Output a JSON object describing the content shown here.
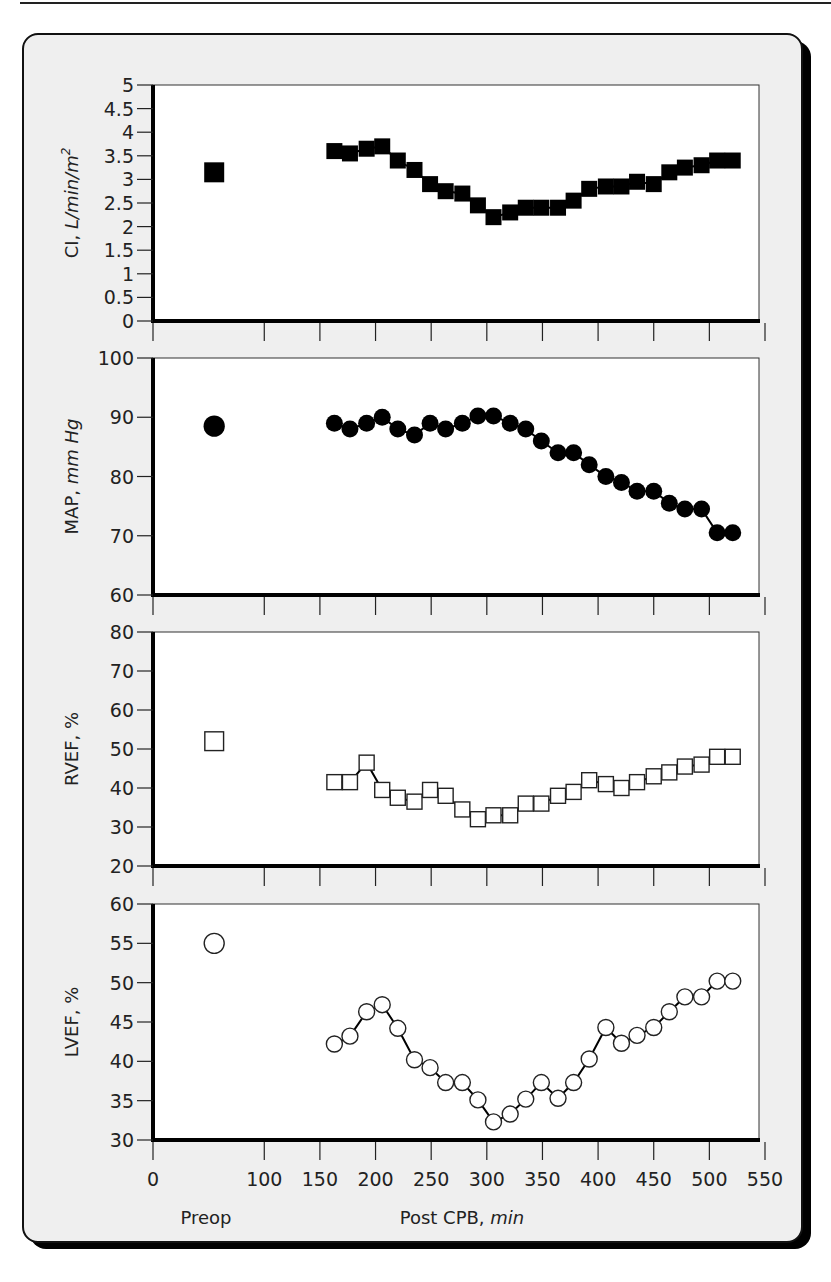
{
  "figure": {
    "xaxis": {
      "ticks": [
        "0",
        "100",
        "150",
        "200",
        "250",
        "300",
        "350",
        "400",
        "450",
        "500",
        "550"
      ],
      "preop_label": "Preop",
      "label_main": "Post CPB, ",
      "label_unit": "min"
    },
    "panels": [
      {
        "ylabel_main": "CI, ",
        "ylabel_unit": "L/min/m",
        "ylabel_sup": "2",
        "yticks": [
          "5",
          "4.5",
          "4",
          "3.5",
          "3",
          "2.5",
          "2",
          "1.5",
          "1",
          "0.5",
          "0"
        ]
      },
      {
        "ylabel_main": "MAP, ",
        "ylabel_unit": "mm Hg",
        "ylabel_sup": "",
        "yticks": [
          "100",
          "90",
          "80",
          "70",
          "60"
        ]
      },
      {
        "ylabel_main": "RVEF, %",
        "ylabel_unit": "",
        "ylabel_sup": "",
        "yticks": [
          "80",
          "70",
          "60",
          "50",
          "40",
          "30",
          "20"
        ]
      },
      {
        "ylabel_main": "LVEF, %",
        "ylabel_unit": "",
        "ylabel_sup": "",
        "yticks": [
          "60",
          "55",
          "50",
          "45",
          "40",
          "35",
          "30"
        ]
      }
    ]
  },
  "chart_data": [
    {
      "type": "line",
      "title": "",
      "ylabel": "CI, L/min/m2",
      "xlabel": "Post CPB, min",
      "ylim": [
        0,
        5
      ],
      "xlim": [
        0,
        550
      ],
      "marker": "filled-square",
      "preop": {
        "x": 55,
        "label": "Preop",
        "value": 3.15
      },
      "x": [
        163,
        177,
        192,
        206,
        220,
        235,
        249,
        263,
        278,
        292,
        306,
        321,
        335,
        349,
        364,
        378,
        392,
        407,
        421,
        435,
        450,
        464,
        478,
        493,
        507,
        521
      ],
      "values": [
        3.6,
        3.55,
        3.65,
        3.7,
        3.4,
        3.2,
        2.9,
        2.75,
        2.7,
        2.45,
        2.2,
        2.3,
        2.4,
        2.4,
        2.4,
        2.55,
        2.8,
        2.85,
        2.85,
        2.95,
        2.9,
        3.15,
        3.25,
        3.3,
        3.4,
        3.4
      ]
    },
    {
      "type": "line",
      "ylabel": "MAP, mm Hg",
      "xlabel": "Post CPB, min",
      "ylim": [
        60,
        100
      ],
      "xlim": [
        0,
        550
      ],
      "marker": "filled-circle",
      "preop": {
        "x": 55,
        "label": "Preop",
        "value": 88.5
      },
      "x": [
        163,
        177,
        192,
        206,
        220,
        235,
        249,
        263,
        278,
        292,
        306,
        321,
        335,
        349,
        364,
        378,
        392,
        407,
        421,
        435,
        450,
        464,
        478,
        493,
        507,
        521
      ],
      "values": [
        89,
        88,
        89,
        90,
        88,
        87,
        89,
        88,
        89,
        90.2,
        90.2,
        89,
        88,
        86,
        84,
        84,
        82,
        80,
        79,
        77.5,
        77.5,
        75.5,
        74.5,
        74.5,
        70.5,
        70.5
      ]
    },
    {
      "type": "line",
      "ylabel": "RVEF, %",
      "xlabel": "Post CPB, min",
      "ylim": [
        20,
        80
      ],
      "xlim": [
        0,
        550
      ],
      "marker": "open-square",
      "preop": {
        "x": 55,
        "label": "Preop",
        "value": 52
      },
      "x": [
        163,
        177,
        192,
        206,
        220,
        235,
        249,
        263,
        278,
        292,
        306,
        321,
        335,
        349,
        364,
        378,
        392,
        407,
        421,
        435,
        450,
        464,
        478,
        493,
        507,
        521
      ],
      "values": [
        41.5,
        41.5,
        46.5,
        39.5,
        37.5,
        36.5,
        39.5,
        38,
        34.5,
        32,
        33,
        33,
        36,
        36,
        38,
        39,
        42,
        41,
        40,
        41.5,
        43,
        44,
        45.5,
        46,
        48,
        48
      ]
    },
    {
      "type": "line",
      "ylabel": "LVEF, %",
      "xlabel": "Post CPB, min",
      "ylim": [
        30,
        60
      ],
      "xlim": [
        0,
        550
      ],
      "marker": "open-circle",
      "preop": {
        "x": 55,
        "label": "Preop",
        "value": 55
      },
      "x": [
        163,
        177,
        192,
        206,
        220,
        235,
        249,
        263,
        278,
        292,
        306,
        321,
        335,
        349,
        364,
        378,
        392,
        407,
        421,
        435,
        450,
        464,
        478,
        493,
        507,
        521
      ],
      "values": [
        42.2,
        43.2,
        46.3,
        47.2,
        44.2,
        40.2,
        39.2,
        37.3,
        37.3,
        35.1,
        32.3,
        33.3,
        35.2,
        37.3,
        35.3,
        37.3,
        40.3,
        44.3,
        42.3,
        43.3,
        44.3,
        46.3,
        48.2,
        48.2,
        50.2,
        50.2
      ]
    }
  ]
}
